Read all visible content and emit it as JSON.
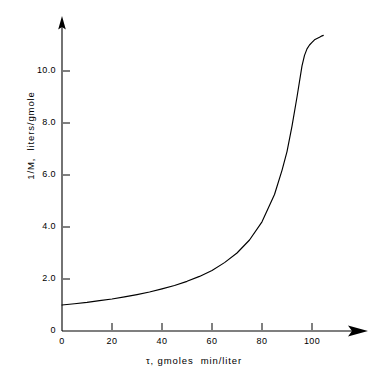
{
  "chart_data": {
    "type": "line",
    "title": "",
    "subtitle": "",
    "xlabel": "τ, gmoles  min/liter",
    "ylabel": "1/M,  liters/gmole",
    "xlim": [
      0,
      112
    ],
    "ylim": [
      0,
      11.6
    ],
    "grid": false,
    "legend": null,
    "xticks": [
      {
        "value": 0,
        "label": "0"
      },
      {
        "value": 20,
        "label": "20"
      },
      {
        "value": 40,
        "label": "40"
      },
      {
        "value": 60,
        "label": "60"
      },
      {
        "value": 80,
        "label": "80"
      },
      {
        "value": 100,
        "label": "100"
      }
    ],
    "yticks": [
      {
        "value": 0,
        "label": "0"
      },
      {
        "value": 2.0,
        "label": "2.0"
      },
      {
        "value": 4.0,
        "label": "4.0"
      },
      {
        "value": 6.0,
        "label": "6.0"
      },
      {
        "value": 8.0,
        "label": "8.0"
      },
      {
        "value": 10.0,
        "label": "10.0"
      }
    ],
    "series": [
      {
        "name": "1/M vs tau",
        "color": "#000000",
        "x": [
          0,
          5,
          10,
          15,
          20,
          25,
          30,
          35,
          40,
          45,
          50,
          55,
          60,
          65,
          70,
          75,
          80,
          85,
          88,
          90,
          92,
          94,
          96,
          97,
          98,
          99,
          100,
          101,
          102,
          103,
          103.5,
          104,
          104.3,
          104.5
        ],
        "y": [
          1.0,
          1.05,
          1.1,
          1.17,
          1.23,
          1.31,
          1.4,
          1.5,
          1.62,
          1.75,
          1.91,
          2.1,
          2.33,
          2.63,
          3.0,
          3.5,
          4.2,
          5.25,
          6.18,
          6.9,
          7.88,
          9.0,
          10.2,
          10.6,
          10.85,
          11.0,
          11.1,
          11.2,
          11.25,
          11.3,
          11.33,
          11.35,
          11.36,
          11.37
        ]
      }
    ],
    "axis_arrows": {
      "x": "right",
      "y": "up"
    },
    "line_color": "#000000",
    "background_color": "#ffffff",
    "axis_color": "#000000"
  },
  "labels": {
    "x_axis_title": "τ, gmoles  min/liter",
    "y_axis_title": "1/M,  liters/gmole",
    "x_tick_0": "0",
    "x_tick_1": "20",
    "x_tick_2": "40",
    "x_tick_3": "60",
    "x_tick_4": "80",
    "x_tick_5": "100",
    "y_tick_0": "0",
    "y_tick_1": "2.0",
    "y_tick_2": "4.0",
    "y_tick_3": "6.0",
    "y_tick_4": "8.0",
    "y_tick_5": "10.0"
  }
}
